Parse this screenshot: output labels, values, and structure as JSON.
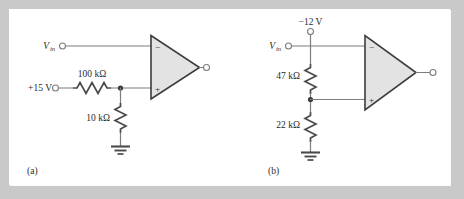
{
  "figure": {
    "background_color": "#c9c9c9",
    "panel_color": "#ffffff",
    "wire_color": "#7d7d7d",
    "opamp_fill": "#e3e3e3",
    "opamp_stroke": "#3c3c3c",
    "resistor_color": "#4a4a4a"
  },
  "circuits": [
    {
      "id": "a",
      "caption": "(a)",
      "input_label": "V",
      "input_label_sub": "in",
      "supply_label": "+15 V",
      "series_resistor": "100 kΩ",
      "shunt_resistor": "10 kΩ",
      "opamp_minus": "−",
      "opamp_plus": "+",
      "minus_terminal": "inverting",
      "plus_terminal": "noninverting",
      "topology": "Vin to inverting input; +15 V through 100 kΩ to divider node, 10 kΩ to ground, node to noninverting input"
    },
    {
      "id": "b",
      "caption": "(b)",
      "input_label": "V",
      "input_label_sub": "in",
      "supply_label": "−12 V",
      "series_resistor": "47 kΩ",
      "shunt_resistor": "22 kΩ",
      "opamp_minus": "−",
      "opamp_plus": "+",
      "minus_terminal": "inverting",
      "plus_terminal": "noninverting",
      "topology": "−12 V at top through 47 kΩ to divider node, 22 kΩ to ground, node to noninverting input; Vin to inverting input"
    }
  ]
}
